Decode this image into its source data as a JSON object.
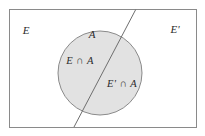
{
  "figure": {
    "type": "venn-diagram",
    "background_color": "#ffffff",
    "universe_rect": {
      "label_left": "E",
      "label_right": "E'",
      "x": 9,
      "y": 9,
      "width": 187,
      "height": 118,
      "stroke_color": "#8a8a8a",
      "fill_color": "#ffffff",
      "stroke_width": 1
    },
    "circle": {
      "label": "A",
      "cx": 100,
      "cy": 73,
      "r": 42,
      "fill_color": "#e2e2e2",
      "stroke_color": "#8a8a8a",
      "stroke_width": 1
    },
    "divider_line": {
      "x1": 136,
      "y1": 9,
      "x2": 74,
      "y2": 127,
      "stroke_color": "#6e6e6e",
      "stroke_width": 1
    },
    "labels": {
      "left_universe": {
        "text": "E",
        "x": 26,
        "y": 34
      },
      "right_universe": {
        "text": "E'",
        "x": 172,
        "y": 33
      },
      "circle_top": {
        "text": "A",
        "x": 92,
        "y": 38
      },
      "region_left": {
        "text": "E ∩ A",
        "x": 64,
        "y": 64
      },
      "region_right": {
        "text": "E' ∩ A",
        "x": 105,
        "y": 87
      }
    }
  }
}
